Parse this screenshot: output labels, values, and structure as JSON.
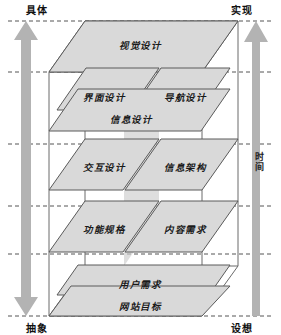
{
  "diagram": {
    "axes": {
      "top_left": "具体",
      "bottom_left": "抽象",
      "top_right": "实现",
      "bottom_right": "设想",
      "right_axis_label": "时间"
    },
    "colors": {
      "plane_fill": "#d9d9d9",
      "plane_stroke": "#5a5a5a",
      "box_stroke": "#6b6b6b",
      "arrow_fill": "#b3b3b3",
      "band_fill": "#cccccc",
      "dashed": "#555555",
      "background": "#ffffff",
      "text": "#1a1a1a"
    },
    "planes": [
      {
        "id": "visual-design",
        "label": "视觉设计",
        "x": 140,
        "y": 45
      },
      {
        "id": "interface-design",
        "label": "界面设计",
        "x": 104,
        "y": 97
      },
      {
        "id": "navigation-design",
        "label": "导航设计",
        "x": 185,
        "y": 97
      },
      {
        "id": "information-design",
        "label": "信息设计",
        "x": 131,
        "y": 119
      },
      {
        "id": "interaction-design",
        "label": "交互设计",
        "x": 104,
        "y": 167
      },
      {
        "id": "information-arch",
        "label": "信息架构",
        "x": 185,
        "y": 167
      },
      {
        "id": "functional-spec",
        "label": "功能规格",
        "x": 104,
        "y": 229
      },
      {
        "id": "content-requirements",
        "label": "内容需求",
        "x": 185,
        "y": 229
      },
      {
        "id": "user-needs",
        "label": "用户需求",
        "x": 140,
        "y": 284
      },
      {
        "id": "site-objectives",
        "label": "网站目标",
        "x": 140,
        "y": 306
      }
    ]
  }
}
